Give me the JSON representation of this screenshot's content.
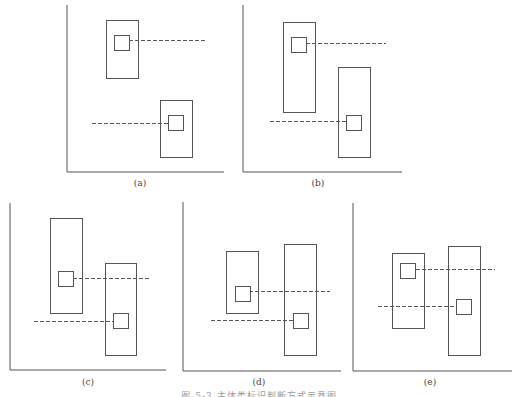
{
  "figure": {
    "caption": "图 5-3  主体类标识判断方式示意图",
    "stroke_color": "#555555",
    "panels": [
      {
        "label": "(a)",
        "axis": {
          "x": 67,
          "y_top": 5,
          "y_bottom": 172,
          "x_right": 224
        },
        "label_pos": {
          "x": 140,
          "y": 178
        },
        "boxes": [
          {
            "x": 106,
            "y": 20,
            "w": 32,
            "h": 58,
            "sq": {
              "x": 114,
              "y": 35,
              "s": 15
            },
            "dash": {
              "x1": 129,
              "x2": 207,
              "y": 40
            }
          },
          {
            "x": 160,
            "y": 100,
            "w": 32,
            "h": 57,
            "sq": {
              "x": 168,
              "y": 115,
              "s": 15
            },
            "dash": {
              "x1": 92,
              "x2": 168,
              "y": 123
            }
          }
        ]
      },
      {
        "label": "(b)",
        "axis": {
          "x": 243,
          "y_top": 5,
          "y_bottom": 172,
          "x_right": 402
        },
        "label_pos": {
          "x": 318,
          "y": 178
        },
        "boxes": [
          {
            "x": 283,
            "y": 22,
            "w": 32,
            "h": 90,
            "sq": {
              "x": 291,
              "y": 37,
              "s": 15
            },
            "dash": {
              "x1": 306,
              "x2": 386,
              "y": 43
            }
          },
          {
            "x": 338,
            "y": 67,
            "w": 32,
            "h": 90,
            "sq": {
              "x": 346,
              "y": 115,
              "s": 15
            },
            "dash": {
              "x1": 270,
              "x2": 346,
              "y": 121
            }
          }
        ]
      },
      {
        "label": "(c)",
        "axis": {
          "x": 10,
          "y_top": 203,
          "y_bottom": 370,
          "x_right": 166
        },
        "label_pos": {
          "x": 88,
          "y": 377
        },
        "boxes": [
          {
            "x": 50,
            "y": 218,
            "w": 32,
            "h": 95,
            "sq": {
              "x": 58,
              "y": 271,
              "s": 15
            },
            "dash": {
              "x1": 73,
              "x2": 149,
              "y": 278
            }
          },
          {
            "x": 105,
            "y": 263,
            "w": 31,
            "h": 92,
            "sq": {
              "x": 113,
              "y": 313,
              "s": 15
            },
            "dash": {
              "x1": 34,
              "x2": 113,
              "y": 321
            }
          }
        ]
      },
      {
        "label": "(d)",
        "axis": {
          "x": 183,
          "y_top": 202,
          "y_bottom": 371,
          "x_right": 341
        },
        "label_pos": {
          "x": 259,
          "y": 377
        },
        "boxes": [
          {
            "x": 226,
            "y": 251,
            "w": 32,
            "h": 62,
            "sq": {
              "x": 235,
              "y": 286,
              "s": 15
            },
            "dash": {
              "x1": 249,
              "x2": 330,
              "y": 291
            }
          },
          {
            "x": 284,
            "y": 244,
            "w": 32,
            "h": 111,
            "sq": {
              "x": 293,
              "y": 313,
              "s": 15
            },
            "dash": {
              "x1": 211,
              "x2": 293,
              "y": 320
            }
          }
        ]
      },
      {
        "label": "(e)",
        "axis": {
          "x": 353,
          "y_top": 203,
          "y_bottom": 371,
          "x_right": 512
        },
        "label_pos": {
          "x": 430,
          "y": 377
        },
        "boxes": [
          {
            "x": 392,
            "y": 253,
            "w": 32,
            "h": 75,
            "sq": {
              "x": 400,
              "y": 263,
              "s": 15
            },
            "dash": {
              "x1": 416,
              "x2": 495,
              "y": 269
            }
          },
          {
            "x": 448,
            "y": 246,
            "w": 32,
            "h": 109,
            "sq": {
              "x": 456,
              "y": 299,
              "s": 15
            },
            "dash": {
              "x1": 378,
              "x2": 456,
              "y": 306
            }
          }
        ]
      }
    ]
  }
}
